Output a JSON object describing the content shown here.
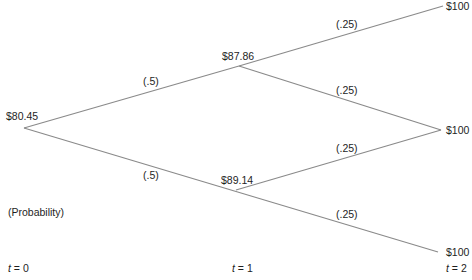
{
  "diagram": {
    "type": "binomial-tree",
    "line_color": "#8a8a8a",
    "nodes": {
      "root": {
        "label": "$80.45"
      },
      "up": {
        "label": "$87.86"
      },
      "down": {
        "label": "$89.14"
      },
      "uu": {
        "label": "$100"
      },
      "ud": {
        "label": "$100"
      },
      "dd": {
        "label": "$100"
      }
    },
    "edges": {
      "root_up": {
        "prob": "(.5)"
      },
      "root_down": {
        "prob": "(.5)"
      },
      "up_uu": {
        "prob": "(.25)"
      },
      "up_ud": {
        "prob": "(.25)"
      },
      "down_ud": {
        "prob": "(.25)"
      },
      "down_dd": {
        "prob": "(.25)"
      }
    },
    "legend": "(Probability)",
    "time_labels": {
      "var": "t",
      "t0": "= 0",
      "t1": "= 1",
      "t2": "= 2"
    }
  }
}
